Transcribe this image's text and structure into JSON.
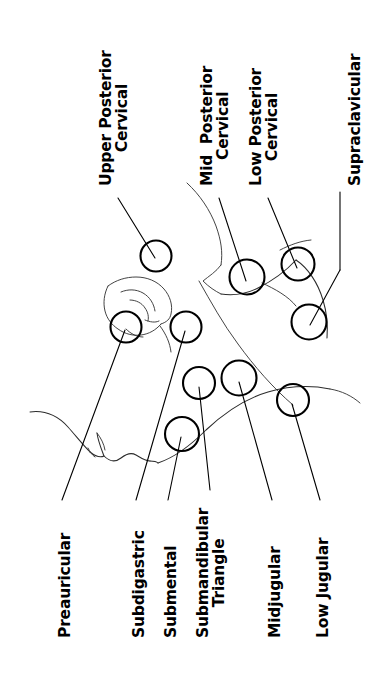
{
  "diagram": {
    "orientation": "labels rotated 90 degrees counter-clockwise",
    "stroke_color": "#000000",
    "background_color": "#ffffff"
  },
  "labels": {
    "upper_posterior_cervical": "Upper Posterior\nCervical",
    "mid_posterior_cervical": "Mid  Posterior\nCervical",
    "low_posterior_cervical": "Low Posterior\nCervical",
    "supraclavicular": "Supraclavicular",
    "preauricular": "Preauricular",
    "subdigastric": "Subdigastric",
    "submental": "Submental",
    "submandibular_triangle": "Submandibular\nTriangle",
    "midjugular": "Midjugular",
    "low_jugular": "Low Jugular"
  },
  "nodes": [
    {
      "id": "upper-posterior-cervical",
      "label": "Upper Posterior Cervical",
      "cx": 156,
      "cy": 256,
      "r": 15.5
    },
    {
      "id": "mid-posterior-cervical",
      "label": "Mid Posterior Cervical",
      "cx": 247,
      "cy": 277,
      "r": 17.5
    },
    {
      "id": "low-posterior-cervical",
      "label": "Low Posterior Cervical",
      "cx": 298,
      "cy": 264,
      "r": 16.5
    },
    {
      "id": "supraclavicular",
      "label": "Supraclavicular",
      "cx": 309,
      "cy": 322,
      "r": 17.5
    },
    {
      "id": "preauricular",
      "label": "Preauricular",
      "cx": 126,
      "cy": 327,
      "r": 15.5
    },
    {
      "id": "subdigastric",
      "label": "Subdigastric",
      "cx": 186,
      "cy": 327,
      "r": 15.5
    },
    {
      "id": "submental",
      "label": "Submental",
      "cx": 182,
      "cy": 434,
      "r": 17.0
    },
    {
      "id": "submandibular-triangle",
      "label": "Submandibular Triangle",
      "cx": 199,
      "cy": 383,
      "r": 16.0
    },
    {
      "id": "midjugular",
      "label": "Midjugular",
      "cx": 239,
      "cy": 378,
      "r": 17.5
    },
    {
      "id": "low-jugular",
      "label": "Low Jugular",
      "cx": 293,
      "cy": 400,
      "r": 16.0
    }
  ],
  "counts": {
    "nodes": 10,
    "labels": 10
  }
}
